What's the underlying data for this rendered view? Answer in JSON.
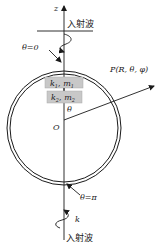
{
  "diagram": {
    "axis_label": "z",
    "incident_wave_top": "入射波",
    "incident_wave_bottom": "入射波",
    "theta_zero": "θ=0",
    "theta_pi": "θ=π",
    "point_label": "P(R, θ, φ)",
    "origin_label": "O",
    "angle_label": "θ",
    "wave_vector_label": "k",
    "box1": {
      "k": "k",
      "k_sub": "1",
      "m": "m",
      "m_sub": "1"
    },
    "box2": {
      "k": "k",
      "k_sub": "2",
      "m": "m",
      "m_sub": "2"
    },
    "colors": {
      "line": "#1a1a1a",
      "box_fill": "#c8c8c8",
      "background": "#ffffff"
    }
  }
}
